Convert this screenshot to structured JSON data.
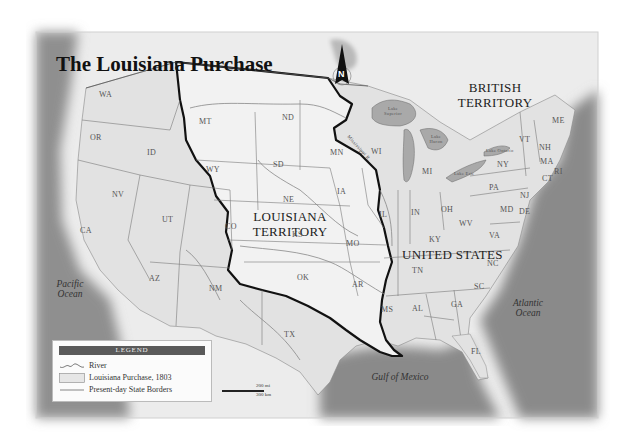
{
  "map": {
    "title": "The Louisiana Purchase",
    "regions": {
      "british_territory": [
        "BRITISH",
        "TERRITORY"
      ],
      "louisiana_territory": [
        "LOUISIANA",
        "TERRITORY"
      ],
      "united_states": "UNITED STATES"
    },
    "water_bodies": {
      "pacific": [
        "Pacific",
        "Ocean"
      ],
      "atlantic": [
        "Atlantic",
        "Ocean"
      ],
      "gulf": "Gulf of Mexico",
      "lake_superior": "Lake Superior",
      "lake_huron": "Lake Huron",
      "lake_michigan": "Lake Michigan",
      "lake_erie": "Lake Erie",
      "lake_ontario": "Lake Ontario"
    },
    "rivers": {
      "mississippi": "Mississippi R."
    },
    "states": [
      {
        "code": "WA",
        "x": 105,
        "y": 95
      },
      {
        "code": "OR",
        "x": 96,
        "y": 138
      },
      {
        "code": "ID",
        "x": 153,
        "y": 153
      },
      {
        "code": "MT",
        "x": 205,
        "y": 122
      },
      {
        "code": "WY",
        "x": 212,
        "y": 170
      },
      {
        "code": "NV",
        "x": 118,
        "y": 195
      },
      {
        "code": "UT",
        "x": 168,
        "y": 220
      },
      {
        "code": "CA",
        "x": 86,
        "y": 231
      },
      {
        "code": "CO",
        "x": 231,
        "y": 227
      },
      {
        "code": "AZ",
        "x": 155,
        "y": 279
      },
      {
        "code": "NM",
        "x": 215,
        "y": 289
      },
      {
        "code": "ND",
        "x": 288,
        "y": 118
      },
      {
        "code": "SD",
        "x": 279,
        "y": 165
      },
      {
        "code": "NE",
        "x": 289,
        "y": 200
      },
      {
        "code": "KS",
        "x": 298,
        "y": 235
      },
      {
        "code": "OK",
        "x": 303,
        "y": 278
      },
      {
        "code": "TX",
        "x": 290,
        "y": 335
      },
      {
        "code": "MN",
        "x": 336,
        "y": 153
      },
      {
        "code": "IA",
        "x": 343,
        "y": 192
      },
      {
        "code": "MO",
        "x": 352,
        "y": 244
      },
      {
        "code": "AR",
        "x": 358,
        "y": 285
      },
      {
        "code": "WI",
        "x": 377,
        "y": 152
      },
      {
        "code": "IL",
        "x": 385,
        "y": 215
      },
      {
        "code": "IN",
        "x": 417,
        "y": 213
      },
      {
        "code": "MI",
        "x": 428,
        "y": 172
      },
      {
        "code": "OH",
        "x": 447,
        "y": 210
      },
      {
        "code": "KY",
        "x": 435,
        "y": 240
      },
      {
        "code": "TN",
        "x": 418,
        "y": 271
      },
      {
        "code": "MS",
        "x": 387,
        "y": 310
      },
      {
        "code": "AL",
        "x": 418,
        "y": 309
      },
      {
        "code": "GA",
        "x": 457,
        "y": 305
      },
      {
        "code": "SC",
        "x": 480,
        "y": 287
      },
      {
        "code": "NC",
        "x": 493,
        "y": 264
      },
      {
        "code": "FL",
        "x": 477,
        "y": 352
      },
      {
        "code": "VA",
        "x": 495,
        "y": 236
      },
      {
        "code": "WV",
        "x": 465,
        "y": 224
      },
      {
        "code": "PA",
        "x": 495,
        "y": 188
      },
      {
        "code": "NY",
        "x": 503,
        "y": 165
      },
      {
        "code": "MD",
        "x": 506,
        "y": 210
      },
      {
        "code": "DE",
        "x": 525,
        "y": 212
      },
      {
        "code": "NJ",
        "x": 526,
        "y": 196
      },
      {
        "code": "VT",
        "x": 525,
        "y": 140
      },
      {
        "code": "NH",
        "x": 545,
        "y": 148
      },
      {
        "code": "ME",
        "x": 558,
        "y": 121
      },
      {
        "code": "MA",
        "x": 546,
        "y": 162
      },
      {
        "code": "CT",
        "x": 548,
        "y": 179
      },
      {
        "code": "RI",
        "x": 560,
        "y": 172
      }
    ],
    "compass": {
      "label": "N"
    },
    "scale": {
      "miles": "200 mi",
      "km": "300 km"
    }
  },
  "legend": {
    "title": "LEGEND",
    "items": [
      {
        "symbol": "river-line",
        "label": "River"
      },
      {
        "symbol": "shaded-box",
        "label": "Louisiana Purchase, 1803"
      },
      {
        "symbol": "thin-line",
        "label": "Present-day State Borders"
      }
    ]
  },
  "colors": {
    "land": "#e4e4e4",
    "louisiana": "#eeeeee",
    "water": "#8c8c8c",
    "purchase_border": "#111111",
    "state_border": "#777777",
    "legend_header": "#5a5a5a"
  }
}
